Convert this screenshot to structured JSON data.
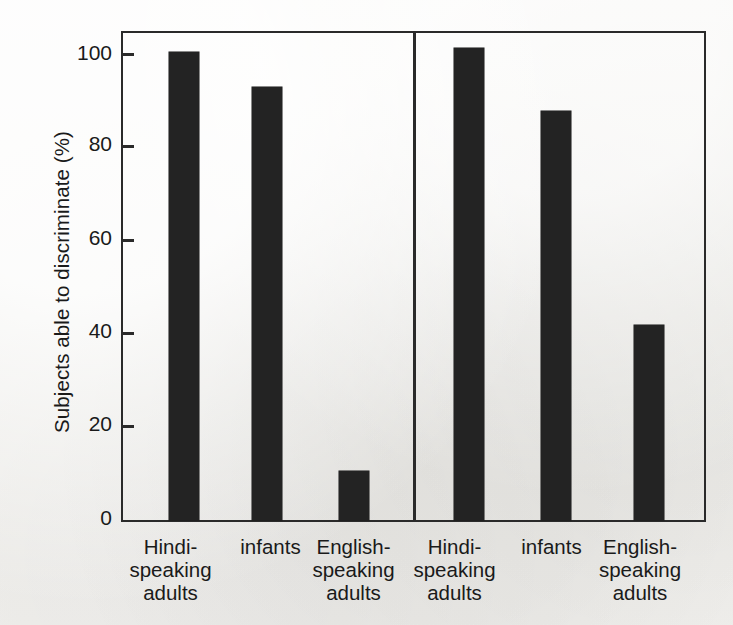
{
  "chart_data": {
    "type": "bar",
    "title": "",
    "xlabel": "",
    "ylabel": "Subjects able to discriminate (%)",
    "ylim": [
      0,
      100
    ],
    "yticks": [
      0,
      20,
      40,
      60,
      80,
      100
    ],
    "ytick_labels": [
      "0",
      "20",
      "40",
      "60",
      "80",
      "100"
    ],
    "grid": false,
    "legend": "none",
    "bar_color": "#232323",
    "axis_color": "#2a2a2a",
    "background_color": "#f2f1ee",
    "panels": [
      {
        "name": "left-panel",
        "categories": [
          "Hindi-speaking adults",
          "infants",
          "English-speaking adults"
        ],
        "values": [
          96,
          89,
          10
        ]
      },
      {
        "name": "right-panel",
        "categories": [
          "Hindi-speaking adults",
          "infants",
          "English-speaking adults"
        ],
        "values": [
          97,
          84,
          40
        ]
      }
    ],
    "category_label_lines": [
      [
        "Hindi-",
        "speaking",
        "adults"
      ],
      [
        "infants"
      ],
      [
        "English-",
        "speaking",
        "adults"
      ]
    ]
  }
}
